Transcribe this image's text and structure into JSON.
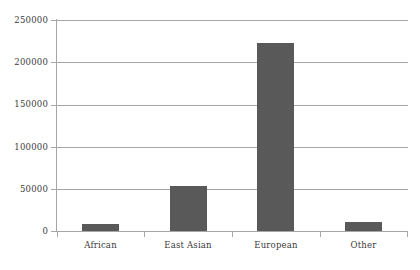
{
  "chart_data": {
    "type": "bar",
    "title": "",
    "subtitle": "",
    "xlabel": "",
    "ylabel": "",
    "categories": [
      "African",
      "East Asian",
      "European",
      "Other"
    ],
    "values": [
      8000,
      53000,
      223000,
      11000
    ],
    "series": [
      {
        "name": "Count",
        "values": [
          8000,
          53000,
          223000,
          11000
        ]
      }
    ],
    "ylim": [
      0,
      250000
    ],
    "ytick_values": [
      0,
      50000,
      100000,
      150000,
      200000,
      250000
    ],
    "ytick_labels": [
      "0",
      "50000",
      "100000",
      "150000",
      "200000",
      "250000"
    ],
    "grid": true,
    "grid_axis": "y",
    "legend": false,
    "legend_position": "none",
    "bar_color": "#595959",
    "grid_color": "#a6a6a6",
    "axis_color": "#a6a6a6",
    "text_color": "#3b3b3b",
    "background_color": "#ffffff"
  }
}
